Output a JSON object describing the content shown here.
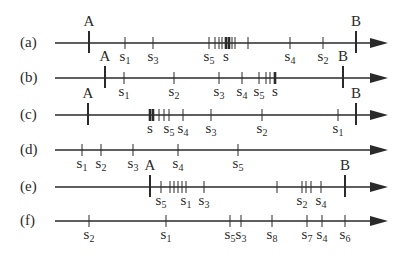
{
  "axis": {
    "x_start": 55,
    "x_end": 372,
    "arrow_tip": 388,
    "color": "#2a2a2a"
  },
  "rows": [
    {
      "id": "a",
      "label": "(a)",
      "y": 43,
      "A": {
        "x": 89,
        "label": "A"
      },
      "B": {
        "x": 356,
        "label": "B"
      },
      "ticks": [
        {
          "x": 125,
          "label": "s",
          "sub": "1"
        },
        {
          "x": 153,
          "label": "s",
          "sub": "3"
        },
        {
          "x": 209,
          "label": "s",
          "sub": "5"
        },
        {
          "x": 215
        },
        {
          "x": 219
        },
        {
          "x": 222
        },
        {
          "x": 226,
          "bold": true,
          "label": "s",
          "sub": ""
        },
        {
          "x": 229,
          "bold": true
        },
        {
          "x": 232
        },
        {
          "x": 235
        },
        {
          "x": 248
        },
        {
          "x": 290,
          "label": "s",
          "sub": "4"
        },
        {
          "x": 323,
          "label": "s",
          "sub": "2"
        }
      ],
      "labels_below": true
    },
    {
      "id": "b",
      "label": "(b)",
      "y": 78,
      "A": {
        "x": 105,
        "label": "A"
      },
      "B": {
        "x": 343,
        "label": "B"
      },
      "ticks": [
        {
          "x": 124,
          "label": "s",
          "sub": "1"
        },
        {
          "x": 174,
          "label": "s",
          "sub": "2"
        },
        {
          "x": 219,
          "label": "s",
          "sub": "3"
        },
        {
          "x": 242,
          "label": "s",
          "sub": "4"
        },
        {
          "x": 259,
          "label": "s",
          "sub": "5"
        },
        {
          "x": 266
        },
        {
          "x": 270
        },
        {
          "x": 275,
          "bold": true,
          "label": "s",
          "sub": ""
        }
      ],
      "labels_below": true
    },
    {
      "id": "c",
      "label": "(c)",
      "y": 115,
      "A": {
        "x": 88,
        "label": "A"
      },
      "B": {
        "x": 356,
        "label": "B"
      },
      "ticks": [
        {
          "x": 150,
          "bold": true,
          "label": "s",
          "sub": ""
        },
        {
          "x": 153,
          "bold": true
        },
        {
          "x": 159
        },
        {
          "x": 164
        },
        {
          "x": 169,
          "label": "s",
          "sub": "5"
        },
        {
          "x": 183,
          "label": "s",
          "sub": "4"
        },
        {
          "x": 211,
          "label": "s",
          "sub": "3"
        },
        {
          "x": 262,
          "label": "s",
          "sub": "2"
        },
        {
          "x": 338,
          "label": "s",
          "sub": "1"
        }
      ],
      "labels_below": true
    },
    {
      "id": "d",
      "label": "(d)",
      "y": 150,
      "A": null,
      "B": null,
      "ticks": [
        {
          "x": 82,
          "label": "s",
          "sub": "1"
        },
        {
          "x": 101,
          "label": "s",
          "sub": "2"
        },
        {
          "x": 133,
          "label": "s",
          "sub": "3"
        },
        {
          "x": 178,
          "label": "s",
          "sub": "4"
        },
        {
          "x": 238,
          "label": "s",
          "sub": "5"
        }
      ],
      "labels_below": true
    },
    {
      "id": "e",
      "label": "(e)",
      "y": 187,
      "A": {
        "x": 150,
        "label": "A"
      },
      "B": {
        "x": 345,
        "label": "B"
      },
      "ticks": [
        {
          "x": 161,
          "label": "s",
          "sub": "5"
        },
        {
          "x": 170
        },
        {
          "x": 174
        },
        {
          "x": 178
        },
        {
          "x": 182
        },
        {
          "x": 186,
          "label": "s",
          "sub": "1"
        },
        {
          "x": 204,
          "label": "s",
          "sub": "3"
        },
        {
          "x": 277
        },
        {
          "x": 302,
          "label": "s",
          "sub": "2"
        },
        {
          "x": 306
        },
        {
          "x": 311
        },
        {
          "x": 321,
          "label": "s",
          "sub": "4"
        }
      ],
      "labels_below": true
    },
    {
      "id": "f",
      "label": "(f)",
      "y": 221,
      "A": null,
      "B": null,
      "ticks": [
        {
          "x": 89,
          "label": "s",
          "sub": "2"
        },
        {
          "x": 166,
          "label": "s",
          "sub": "1"
        },
        {
          "x": 230,
          "label": "s",
          "sub": "5"
        },
        {
          "x": 241,
          "label": "s",
          "sub": "3"
        },
        {
          "x": 272,
          "label": "s",
          "sub": "8"
        },
        {
          "x": 307,
          "label": "s",
          "sub": "7"
        },
        {
          "x": 322,
          "label": "s",
          "sub": "4"
        },
        {
          "x": 345,
          "label": "s",
          "sub": "6"
        }
      ],
      "labels_below": true
    }
  ]
}
